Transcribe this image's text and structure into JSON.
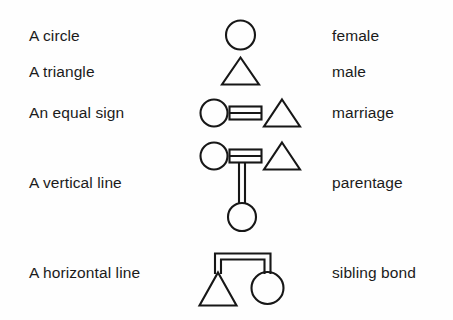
{
  "legend": {
    "title": "Kinship diagram symbols",
    "rows": [
      {
        "id": "circle",
        "description": "A circle",
        "term": "female",
        "symbol": "circle-symbol"
      },
      {
        "id": "triangle",
        "description": "A triangle",
        "term": "male",
        "symbol": "triangle-symbol"
      },
      {
        "id": "equal",
        "description": "An equal sign",
        "term": "marriage",
        "symbol": "marriage-symbol"
      },
      {
        "id": "vertical",
        "description": "A vertical line",
        "term": "parentage",
        "symbol": "parentage-symbol"
      },
      {
        "id": "horizontal",
        "description": "A horizontal line",
        "term": "sibling bond",
        "symbol": "sibling-bond-symbol"
      }
    ]
  },
  "style": {
    "ink": "#171717",
    "paper": "#fefefe"
  }
}
